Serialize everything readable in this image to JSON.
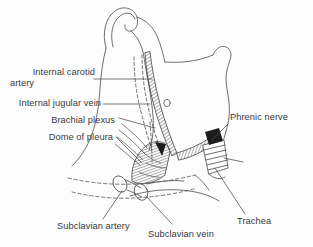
{
  "figure": {
    "background_color": "#fdfdfd",
    "ink_color": "#4a4a4c",
    "text_color": "#3a3a3c"
  },
  "labels": {
    "internal_carotid_artery_line1": "Internal carotid",
    "internal_carotid_artery_line2": "artery",
    "internal_jugular_vein": "Internal jugular vein",
    "brachial_plexus": "Brachial plexus",
    "dome_of_pleura": "Dome of pleura",
    "phrenic_nerve": "Phrenic nerve",
    "trachea": "Trachea",
    "subclavian_artery": "Subclavian artery",
    "subclavian_vein": "Subclavian vein"
  },
  "structures": [
    {
      "name": "internal-carotid-artery",
      "style": "hatched-strip"
    },
    {
      "name": "internal-jugular-vein",
      "style": "dashed-outline"
    },
    {
      "name": "brachial-plexus",
      "style": "line-bundle"
    },
    {
      "name": "dome-of-pleura",
      "style": "hatched-dome"
    },
    {
      "name": "phrenic-nerve",
      "style": "solid-black-block"
    },
    {
      "name": "trachea",
      "style": "ringed-tube"
    },
    {
      "name": "subclavian-artery",
      "style": "oval-stump"
    },
    {
      "name": "subclavian-vein",
      "style": "oval-stump"
    },
    {
      "name": "first-rib",
      "style": "dashed-contour"
    },
    {
      "name": "clavicle",
      "style": "dashed-contour"
    },
    {
      "name": "mandible",
      "style": "outline"
    },
    {
      "name": "sternocleidomastoid",
      "style": "outline"
    }
  ]
}
